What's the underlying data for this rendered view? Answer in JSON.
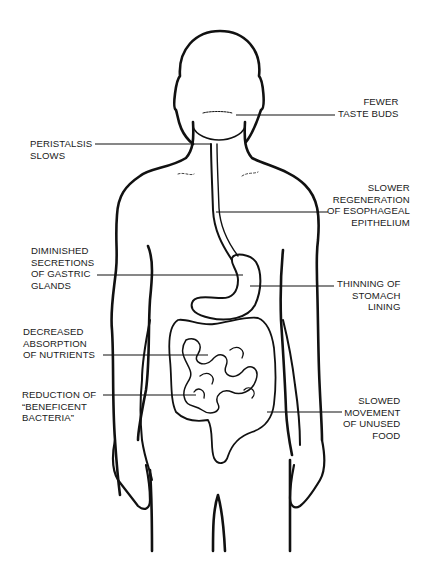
{
  "colors": {
    "line": "#111111",
    "text": "#1a1a1a",
    "background": "#ffffff"
  },
  "labels": {
    "taste": "FEWER\nTASTE BUDS",
    "peristalsis": "PERISTALSIS\nSLOWS",
    "esophageal": "SLOWER\nREGENERATION\nOF ESOPHAGEAL\nEPITHELIUM",
    "gastric": "DIMINISHED\nSECRETIONS\nOF GASTRIC\nGLANDS",
    "stomach": "THINNING OF\nSTOMACH\nLINING",
    "absorption": "DECREASED\nABSORPTION\nOF NUTRIENTS",
    "bacteria": "REDUCTION OF\n“BENEFICENT\nBACTERIA”",
    "movement": "SLOWED\nMOVEMENT\nOF UNUSED\nFOOD"
  }
}
